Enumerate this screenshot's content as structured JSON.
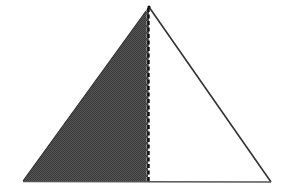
{
  "diagram": {
    "type": "triangle-split",
    "colors": {
      "background": "#ffffff",
      "shaded_fill": "#4a4a4a",
      "outline": "#333333",
      "dashed_line": "#111111"
    },
    "triangle": {
      "apex": [
        149,
        7
      ],
      "base_left": [
        23,
        181
      ],
      "base_right": [
        271,
        182
      ]
    },
    "divider": {
      "style": "dashed",
      "x": 148
    },
    "shaded_region": "left"
  }
}
